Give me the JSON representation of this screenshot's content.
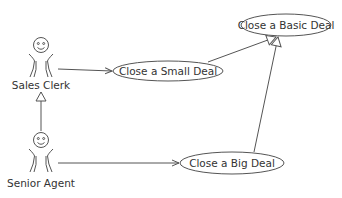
{
  "diagram": {
    "type": "uml-use-case",
    "colors": {
      "line": "#555555",
      "text": "#333333",
      "background": "#ffffff"
    },
    "actors": [
      {
        "id": "sales_clerk",
        "label": "Sales Clerk"
      },
      {
        "id": "senior_agent",
        "label": "Senior Agent"
      }
    ],
    "use_cases": [
      {
        "id": "basic",
        "label": "Close a Basic Deal"
      },
      {
        "id": "small",
        "label": "Close a Small Deal"
      },
      {
        "id": "big",
        "label": "Close a Big Deal"
      }
    ],
    "relationships": [
      {
        "from": "sales_clerk",
        "to": "small",
        "kind": "association"
      },
      {
        "from": "senior_agent",
        "to": "big",
        "kind": "association"
      },
      {
        "from": "senior_agent",
        "to": "sales_clerk",
        "kind": "generalization"
      },
      {
        "from": "small",
        "to": "basic",
        "kind": "generalization"
      },
      {
        "from": "big",
        "to": "basic",
        "kind": "generalization"
      }
    ]
  }
}
